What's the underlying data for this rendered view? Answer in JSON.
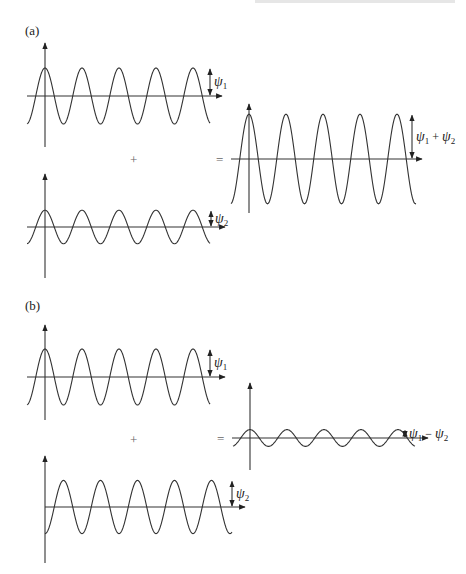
{
  "header": {
    "partial_text": ""
  },
  "panels": [
    {
      "id": "a",
      "label": "(a)",
      "operator_plus": "+",
      "operator_equals": "=",
      "waves": [
        {
          "role": "psi1",
          "label_main": "ψ",
          "label_sub": "1",
          "relative_amplitude": 1.0,
          "phase": "cos",
          "cycles": 5
        },
        {
          "role": "psi2",
          "label_main": "ψ",
          "label_sub": "2",
          "relative_amplitude": 0.6,
          "phase": "cos",
          "cycles": 5
        },
        {
          "role": "sum",
          "label_main": "ψ",
          "label_sub": "1",
          "label_op": " + ",
          "label_main2": "ψ",
          "label_sub2": "2",
          "relative_amplitude": 1.6,
          "phase": "cos",
          "cycles": 5
        }
      ]
    },
    {
      "id": "b",
      "label": "(b)",
      "operator_plus": "+",
      "operator_equals": "=",
      "waves": [
        {
          "role": "psi1",
          "label_main": "ψ",
          "label_sub": "1",
          "relative_amplitude": 1.0,
          "phase": "cos",
          "cycles": 5
        },
        {
          "role": "psi2",
          "label_main": "ψ",
          "label_sub": "2",
          "relative_amplitude": 0.95,
          "phase": "-cos",
          "cycles": 5
        },
        {
          "role": "difference",
          "label_main": "ψ",
          "label_sub": "1",
          "label_op": " − ",
          "label_main2": "ψ",
          "label_sub2": "2",
          "relative_amplitude": 0.3,
          "phase": "cos",
          "cycles": 5
        }
      ]
    }
  ]
}
